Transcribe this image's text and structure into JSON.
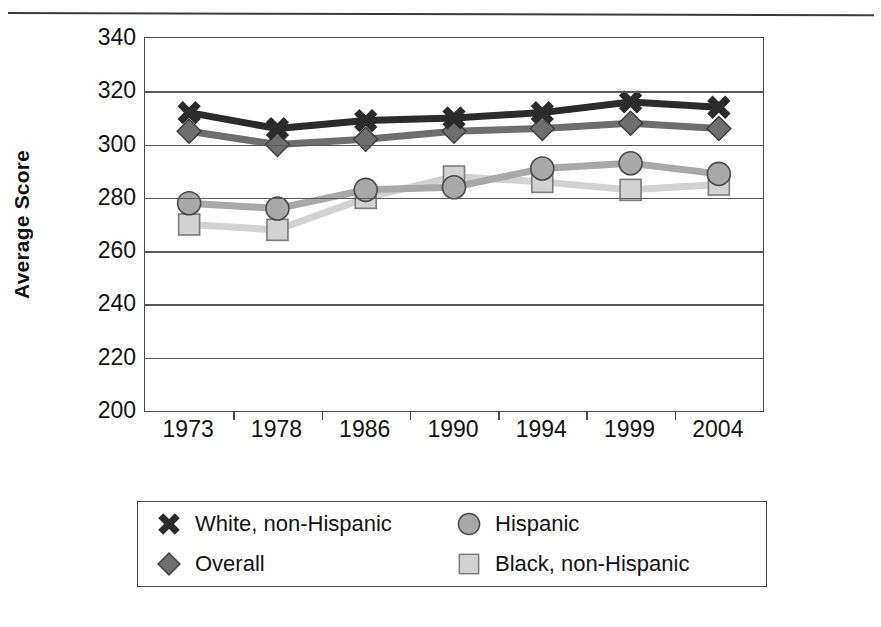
{
  "figure": {
    "y_axis_title": "Average Score",
    "legend_box": true
  },
  "chart_data": {
    "type": "line",
    "title": "",
    "xlabel": "",
    "ylabel": "Average Score",
    "categories": [
      "1973",
      "1978",
      "1986",
      "1990",
      "1994",
      "1999",
      "2004"
    ],
    "ylim": [
      200,
      340
    ],
    "yticks": [
      200,
      220,
      240,
      260,
      280,
      300,
      320,
      340
    ],
    "grid": true,
    "legend_position": "below",
    "series": [
      {
        "name": "White, non-Hispanic",
        "marker": "x-cross",
        "color": "#2b2b2b",
        "values": [
          312,
          306,
          309,
          310,
          312,
          316,
          314
        ]
      },
      {
        "name": "Overall",
        "marker": "diamond",
        "color": "#6e6e6e",
        "values": [
          305,
          300,
          302,
          305,
          306,
          308,
          306
        ]
      },
      {
        "name": "Hispanic",
        "marker": "circle",
        "color": "#a8a8a8",
        "values": [
          278,
          276,
          283,
          284,
          291,
          293,
          289
        ]
      },
      {
        "name": "Black, non-Hispanic",
        "marker": "square",
        "color": "#d2d2d2",
        "values": [
          270,
          268,
          280,
          288,
          286,
          283,
          285
        ]
      }
    ]
  },
  "legend": {
    "items": [
      {
        "label": "White, non-Hispanic",
        "marker": "x-cross",
        "color": "#2b2b2b"
      },
      {
        "label": "Hispanic",
        "marker": "circle",
        "color": "#a8a8a8"
      },
      {
        "label": "Overall",
        "marker": "diamond",
        "color": "#6e6e6e"
      },
      {
        "label": "Black, non-Hispanic",
        "marker": "square",
        "color": "#d2d2d2"
      }
    ]
  }
}
